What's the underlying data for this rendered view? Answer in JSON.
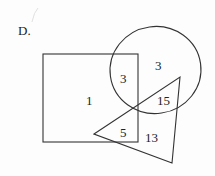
{
  "label": "D.",
  "regions": {
    "square_only": "1",
    "square_circle": "3",
    "circle_only": "3",
    "circle_triangle": "15",
    "square_triangle": "5",
    "triangle_only": "13"
  },
  "colors": {
    "stroke": "#333333",
    "text": "#222222"
  }
}
